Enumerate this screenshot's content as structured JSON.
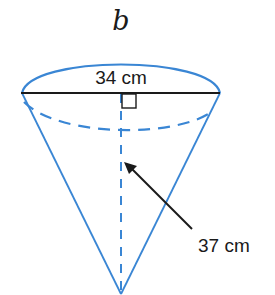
{
  "diagram": {
    "part_label": "b",
    "shape": "cone",
    "diameter_label": "34 cm",
    "slant_or_height_label": "37 cm",
    "colors": {
      "outline": "#3a86d4",
      "dimension_line": "#1a1a1a",
      "text": "#1a1a1a"
    }
  }
}
